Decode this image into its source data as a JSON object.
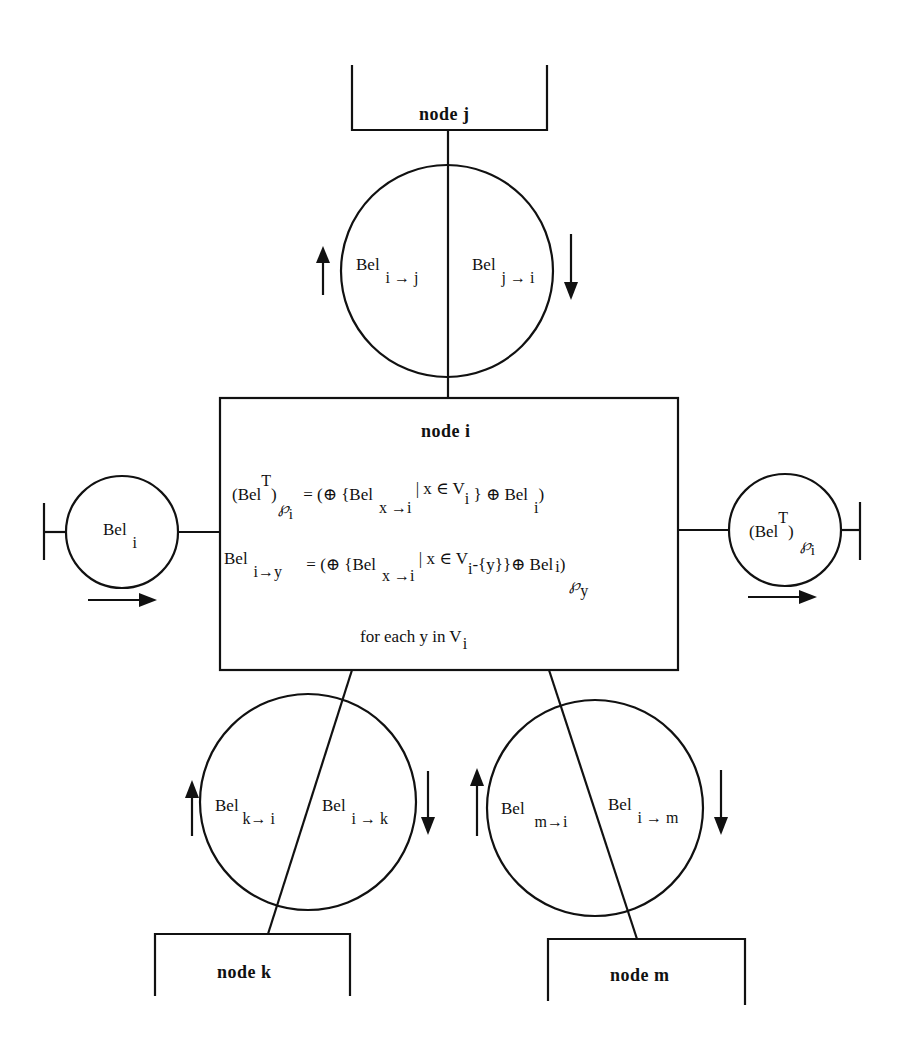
{
  "diagram": {
    "nodes": {
      "j": {
        "label": "node j"
      },
      "i": {
        "label": "node i"
      },
      "k": {
        "label": "node k"
      },
      "m": {
        "label": "node m"
      }
    },
    "messages": {
      "ij": {
        "base": "Bel",
        "sub": "i → j",
        "direction": "up"
      },
      "ji": {
        "base": "Bel",
        "sub": "j → i",
        "direction": "down"
      },
      "ki": {
        "base": "Bel",
        "sub": "k→ i",
        "direction": "up"
      },
      "ik": {
        "base": "Bel",
        "sub": "i → k",
        "direction": "down"
      },
      "mi": {
        "base": "Bel",
        "sub": "m→i",
        "direction": "up"
      },
      "im": {
        "base": "Bel",
        "sub": "i → m",
        "direction": "down"
      }
    },
    "input": {
      "base": "Bel",
      "sub": "i",
      "direction": "right"
    },
    "output": {
      "open": "(Bel",
      "sup": "T",
      "close": ")",
      "pset": "℘",
      "sub": "i",
      "direction": "right"
    },
    "equations": {
      "eq1": {
        "lhs_open": "(Bel",
        "lhs_sup": "T",
        "lhs_close": ")",
        "lhs_pset": "℘",
        "lhs_sub": "i",
        "rhs_a": "= (⊕ {Bel",
        "rhs_a_sub": "x →i",
        "rhs_b": "| x ∈  V",
        "rhs_b_sub": "i",
        "rhs_c": " }  ⊕  Bel",
        "rhs_c_sub": "i",
        "rhs_d": ")"
      },
      "eq2": {
        "lhs": "Bel",
        "lhs_sub": "i→y",
        "rhs_a": "= (⊕ {Bel",
        "rhs_a_sub": "x →i",
        "rhs_b": "| x ∈  V",
        "rhs_b_sub": "i",
        "rhs_c": "-{y}}⊕ Bel",
        "rhs_c_sub": "i",
        "rhs_d": ")",
        "proj_pset": "℘",
        "proj_sub": "y"
      },
      "note": "for each y  in V",
      "note_sub": "i"
    }
  }
}
